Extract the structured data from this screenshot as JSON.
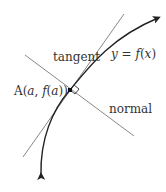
{
  "diagram": {
    "labels": {
      "tangent": "tangent",
      "curve": "y = f(x)",
      "curve_y": "y",
      "curve_eq": " = ",
      "curve_f": "f",
      "curve_paren_open": "(",
      "curve_x": "x",
      "curve_paren_close": ")",
      "point": "A(a, f(a))",
      "point_A": "A",
      "point_open": "(",
      "point_a": "a",
      "point_comma": ", ",
      "point_f": "f",
      "point_open2": "(",
      "point_a2": "a",
      "point_close": "))",
      "normal": "normal"
    },
    "colors": {
      "curve": "#222222",
      "tangent_line": "#888888",
      "normal_line": "#888888",
      "text": "#333333",
      "point": "#111111"
    }
  }
}
